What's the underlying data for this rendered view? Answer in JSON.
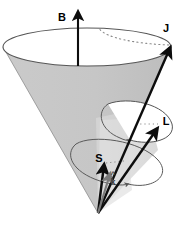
{
  "figure": {
    "background_color": "#ffffff",
    "canvas": {
      "width": 184,
      "height": 233
    }
  },
  "colors": {
    "cone_fill": "#c9c9c9",
    "cone_inner_fill": "#dcdcdc",
    "cone_outline": "#555555",
    "arrow_black": "#0d0d0d",
    "arrow_gray": "#7a7a7a",
    "curve_stroke": "#5a5a5a",
    "dotted_stroke": "#8a8a8a",
    "label_color": "#000000",
    "label_color_small": "#3c3c3c"
  },
  "labels": {
    "b_field": "B",
    "total_angular_momentum": "J",
    "orbital_angular_momentum": "L",
    "spin_angular_momentum": "S",
    "unit_vector_k": "k",
    "unit_vector_k_hat": "^"
  },
  "vectors": [
    {
      "id": "b-vector",
      "label": "B",
      "description": "Magnetic field, vertical axis of the cone",
      "color": "#0d0d0d",
      "from": {
        "x": 78,
        "y": 62
      },
      "to": {
        "x": 78,
        "y": 10
      },
      "label_pos": {
        "x": 66,
        "y": 17
      }
    },
    {
      "id": "j-vector",
      "label": "J",
      "description": "Total angular momentum, along the cone surface to the top rim",
      "color": "#0d0d0d",
      "from": {
        "x": 98,
        "y": 213
      },
      "to": {
        "x": 171,
        "y": 46
      },
      "label_pos": {
        "x": 164,
        "y": 29
      }
    },
    {
      "id": "l-vector",
      "label": "L",
      "description": "Orbital angular momentum, to the middle precession circle",
      "color": "#0d0d0d",
      "from": {
        "x": 98,
        "y": 213
      },
      "to": {
        "x": 158,
        "y": 128
      },
      "label_pos": {
        "x": 164,
        "y": 121
      }
    },
    {
      "id": "s-vector",
      "label": "S",
      "description": "Spin angular momentum, short arrow to the lower precession circle",
      "color": "#0d0d0d",
      "from": {
        "x": 98,
        "y": 213
      },
      "to": {
        "x": 104,
        "y": 163
      },
      "label_pos": {
        "x": 99,
        "y": 161
      }
    },
    {
      "id": "k-hat-vector",
      "label": "k",
      "description": "Unit vector k-hat, short gray arrow from the apex",
      "color": "#7a7a7a",
      "from": {
        "x": 98,
        "y": 213
      },
      "to": {
        "x": 110,
        "y": 172
      },
      "label_pos": {
        "x": 111,
        "y": 184
      },
      "hat_pos": {
        "x": 112,
        "y": 176
      }
    }
  ],
  "cone": {
    "apex": {
      "x": 98,
      "y": 213
    },
    "rim_center": {
      "x": 87,
      "y": 47
    },
    "rim_rx": 84,
    "rim_ry": 19
  },
  "precession_circles": [
    {
      "id": "top-rim-circle",
      "description": "Top rim of the cone with dotted back edge",
      "center": {
        "x": 87,
        "y": 47
      },
      "rx": 84,
      "ry": 19
    },
    {
      "id": "middle-precession-circle",
      "description": "Precession circle of L, tilted ellipse",
      "center": {
        "x": 137,
        "y": 118
      },
      "rx": 35,
      "ry": 15
    },
    {
      "id": "lower-precession-circle",
      "description": "Precession circle of S, tilted ellipse",
      "center": {
        "x": 112,
        "y": 160
      },
      "rx": 44,
      "ry": 18
    }
  ]
}
